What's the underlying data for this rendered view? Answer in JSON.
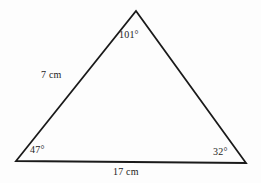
{
  "figure": {
    "kind": "triangle-diagram",
    "background_color": "#fdfdfd",
    "stroke_color": "#1a1a1a",
    "stroke_width": 1.8,
    "text_color": "#1c1c1c"
  },
  "labels": {
    "apex_angle": "101°",
    "left_side": "7 cm",
    "left_angle": "47°",
    "right_angle": "32°",
    "base_side": "17 cm"
  },
  "chart_data": {
    "type": "diagram",
    "shape": "triangle",
    "title": "",
    "vertices": [
      {
        "name": "apex",
        "x": 136,
        "y": 11
      },
      {
        "name": "bottom-left",
        "x": 16,
        "y": 161
      },
      {
        "name": "bottom-right",
        "x": 246,
        "y": 163
      }
    ],
    "angles": [
      {
        "at": "apex",
        "value": 101,
        "unit": "degrees",
        "label": "101°"
      },
      {
        "at": "bottom-left",
        "value": 47,
        "unit": "degrees",
        "label": "47°"
      },
      {
        "at": "bottom-right",
        "value": 32,
        "unit": "degrees",
        "label": "32°"
      }
    ],
    "sides": [
      {
        "from": "bottom-left",
        "to": "apex",
        "value": 7,
        "unit": "cm",
        "label": "7 cm"
      },
      {
        "from": "bottom-left",
        "to": "bottom-right",
        "value": 17,
        "unit": "cm",
        "label": "17 cm"
      },
      {
        "from": "apex",
        "to": "bottom-right",
        "value": null,
        "unit": "cm",
        "label": ""
      }
    ],
    "angle_sum": 180,
    "labeled_sides_count": 2,
    "labeled_angles_count": 3
  }
}
